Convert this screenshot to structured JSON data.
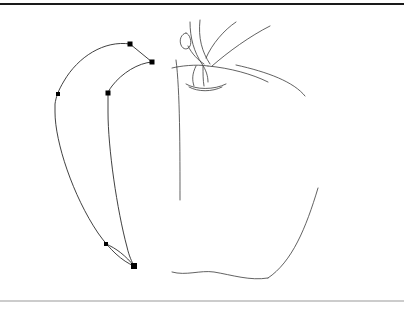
{
  "canvas": {
    "title": "Vector Drawing Canvas",
    "width": 404,
    "height": 317,
    "background_color": "#ffffff",
    "stroke_color": "#2b2b2b"
  },
  "rules": {
    "top": {
      "label": "top-rule",
      "y": 4,
      "color": "#1a1a1a",
      "thickness": 2.2
    },
    "bottom": {
      "label": "bottom-rule",
      "y": 301,
      "color": "#9a9a9a",
      "thickness": 1.2
    }
  },
  "shapes": {
    "banana": {
      "label": "banana-outline",
      "outer_path": "M 130 44 C 104 40 78 57 64 81 C 58 91 56 97 55 104 L 55 112 C 55 142 73 196 98 233 C 110 250 122 261 134 266",
      "inner_path": "M 152 62 C 138 63 122 73 112 86 C 109 90 108 92 108 95 L 108 112 C 108 148 117 210 127 247 C 129 256 132 262 134 266",
      "connector_path": "M 130 44 L 152 62",
      "bottom_connector_path": "M 106 244 C 116 248 126 256 134 266",
      "stroke_color": "#2b2b2b"
    },
    "apple": {
      "label": "apple-outline",
      "body_left_path": "M 176 60 C 180 90 180 150 180 200",
      "body_right_path": "M 236 65 C 268 72 294 82 305 96",
      "shoulder_left_path": "M 172 68 C 180 66 196 64 208 66",
      "shoulder_right_path": "M 208 66 C 230 68 252 74 268 82",
      "lower_right_path": "M 318 188 C 306 228 292 262 268 278",
      "bottom_path": "M 172 272 C 186 276 200 270 214 272 C 232 275 250 281 268 278",
      "stroke_color": "#2b2b2b"
    },
    "stem": {
      "label": "apple-stem",
      "left_stem_path": "M 190 22 C 190 38 194 52 202 64 C 206 70 208 76 208 82",
      "right_stem_path": "M 200 20 C 198 38 202 52 210 64",
      "stem_base_path": "M 203 66 C 203 74 203 80 204 86",
      "stem_cup_path": "M 186 84 C 196 90 214 90 226 84",
      "stem_cup_inner_path": "M 189 87 C 198 92 212 92 222 87"
    },
    "leaf": {
      "label": "apple-leaf",
      "leaf_path": "M 186 33 C 181 34 179 40 181 45 C 183 50 188 50 190 46 C 192 42 190 34 186 33",
      "leaf_vein_path": "M 188 46 C 192 54 198 60 204 64"
    },
    "branch_curves": {
      "label": "branch-curves",
      "curve_one_path": "M 236 22 C 224 30 212 44 206 58",
      "curve_two_path": "M 270 26 C 250 36 228 52 212 66",
      "curve_three_path": "M 196 66 C 192 74 192 80 194 86"
    }
  },
  "nodes": {
    "label": "editable-nodes",
    "color": "#000000",
    "items": [
      {
        "name": "node-top-outer",
        "x": 130,
        "y": 44,
        "size": 5,
        "selected": false
      },
      {
        "name": "node-top-right",
        "x": 152,
        "y": 62,
        "size": 5,
        "selected": false
      },
      {
        "name": "node-left-upper",
        "x": 58,
        "y": 94,
        "size": 4,
        "selected": false
      },
      {
        "name": "node-inner-upper",
        "x": 108,
        "y": 93,
        "size": 5,
        "selected": false
      },
      {
        "name": "node-bottom-left",
        "x": 106,
        "y": 244,
        "size": 4,
        "selected": false
      },
      {
        "name": "node-bottom-tip",
        "x": 134,
        "y": 266,
        "size": 6,
        "selected": true
      }
    ]
  }
}
